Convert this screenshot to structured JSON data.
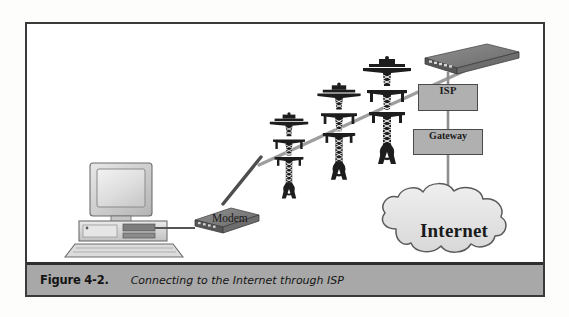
{
  "figure": {
    "caption_label": "Figure 4-2.",
    "caption_text": "Connecting to the Internet through ISP",
    "frame_border_color": "#3a3a3a",
    "caption_bar_color": "#a8a8a8"
  },
  "diagram": {
    "type": "network-topology",
    "title": "Connecting to the Internet through ISP",
    "nodes": [
      {
        "id": "workstation",
        "label": "",
        "icon": "desktop-computer-icon"
      },
      {
        "id": "modem",
        "label": "Modem",
        "icon": "modem-device-icon"
      },
      {
        "id": "tower1",
        "label": "",
        "icon": "transmission-tower-icon"
      },
      {
        "id": "tower2",
        "label": "",
        "icon": "transmission-tower-icon"
      },
      {
        "id": "tower3",
        "label": "",
        "icon": "transmission-tower-icon"
      },
      {
        "id": "router",
        "label": "",
        "icon": "router-device-icon"
      },
      {
        "id": "isp",
        "label": "ISP",
        "icon": "box-node-icon"
      },
      {
        "id": "gateway",
        "label": "Gateway",
        "icon": "box-node-icon"
      },
      {
        "id": "internet",
        "label": "Internet",
        "icon": "cloud-icon"
      }
    ],
    "links": [
      {
        "from": "workstation",
        "to": "modem"
      },
      {
        "from": "modem",
        "to": "tower1"
      },
      {
        "from": "tower1",
        "to": "router"
      },
      {
        "from": "router",
        "to": "isp"
      },
      {
        "from": "isp",
        "to": "gateway"
      },
      {
        "from": "gateway",
        "to": "internet"
      }
    ],
    "labels": {
      "modem": "Modem",
      "isp": "ISP",
      "gateway": "Gateway",
      "internet": "Internet"
    },
    "colors": {
      "node_fill": "#b0b0b0",
      "node_border": "#4a4a4a",
      "link_light": "#9a9a9a",
      "link_dark": "#4e4e4e",
      "device_dark": "#6e6e6e",
      "cloud_fill": "#e3e3e3"
    }
  }
}
